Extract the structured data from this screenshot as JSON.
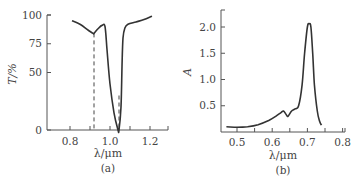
{
  "chart_data": [
    {
      "type": "line",
      "panel": "(a)",
      "title": "",
      "xlabel": "λ/μm",
      "ylabel": "T/%",
      "xlim": [
        0.68,
        1.29
      ],
      "ylim": [
        0,
        100
      ],
      "xticks": [
        0.8,
        0.9,
        1.0,
        1.1,
        1.2,
        1.3
      ],
      "xtick_labels": [
        "0.8",
        "1.0",
        "1.2"
      ],
      "yticks": [
        0,
        50,
        75,
        100
      ],
      "ytick_labels": [
        "0",
        "50",
        "75",
        "100"
      ],
      "grid": false,
      "series": [
        {
          "name": "Transmission",
          "x": [
            0.81,
            0.85,
            0.89,
            0.915,
            0.92,
            0.94,
            0.96,
            0.975,
            0.985,
            1.0,
            1.02,
            1.04,
            1.045,
            1.055,
            1.06,
            1.065,
            1.075,
            1.09,
            1.13,
            1.17,
            1.21
          ],
          "y": [
            95,
            92,
            87,
            84,
            84,
            88,
            91,
            90,
            70,
            40,
            15,
            0,
            0,
            20,
            55,
            80,
            89,
            92,
            94,
            96,
            99
          ]
        }
      ],
      "annotations": [
        {
          "type": "dashed_vline",
          "x": 0.92,
          "y_from": 0,
          "y_to": 84
        },
        {
          "type": "dashed_vline",
          "x": 1.045,
          "y_from": 0,
          "y_to": 30
        }
      ]
    },
    {
      "type": "line",
      "panel": "(b)",
      "title": "",
      "xlabel": "λ/μm",
      "ylabel": "A",
      "xlim": [
        0.455,
        0.81
      ],
      "ylim": [
        0,
        2.3
      ],
      "xticks": [
        0.5,
        0.55,
        0.6,
        0.65,
        0.7,
        0.75,
        0.8
      ],
      "xtick_labels": [
        "0.5",
        "0.6",
        "0.7",
        "0.8"
      ],
      "yticks": [
        0.5,
        1.0,
        1.5,
        2.0
      ],
      "ytick_labels": [
        "0.5",
        "1.0",
        "1.5",
        "2.0"
      ],
      "grid": false,
      "series": [
        {
          "name": "Absorbance",
          "x": [
            0.47,
            0.5,
            0.53,
            0.56,
            0.59,
            0.61,
            0.625,
            0.632,
            0.64,
            0.645,
            0.655,
            0.665,
            0.675,
            0.685,
            0.692,
            0.7,
            0.705,
            0.71,
            0.715,
            0.72,
            0.728,
            0.735,
            0.74
          ],
          "y": [
            0.1,
            0.09,
            0.1,
            0.14,
            0.22,
            0.3,
            0.37,
            0.4,
            0.33,
            0.3,
            0.4,
            0.44,
            0.5,
            0.9,
            1.5,
            2.0,
            2.06,
            2.0,
            1.5,
            0.9,
            0.4,
            0.2,
            0.13
          ]
        }
      ]
    }
  ]
}
